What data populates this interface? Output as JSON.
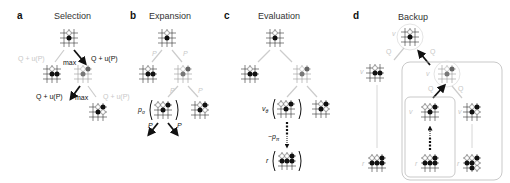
{
  "figure": {
    "panels": [
      {
        "letter": "a",
        "title": "Selection"
      },
      {
        "letter": "b",
        "title": "Expansion"
      },
      {
        "letter": "c",
        "title": "Evaluation"
      },
      {
        "letter": "d",
        "title": "Backup"
      }
    ],
    "selection": {
      "left_edge_label": "Q + u(P)",
      "right_edge_label": "Q + u(P)",
      "max_label_1": "max",
      "second_left_label": "Q + u(P)",
      "max_label_2": "max",
      "second_right_label": "Q + u(P)"
    },
    "expansion": {
      "edge_p": "P",
      "policy_label": "p",
      "policy_sub": "σ",
      "out_left": "P",
      "out_right": "P"
    },
    "evaluation": {
      "value_label": "v",
      "value_sub": "θ",
      "rollout_label": "p",
      "rollout_sub": "π",
      "reward_label": "r"
    },
    "backup": {
      "q_label": "Q",
      "v_label": "v",
      "v_sub": "θ",
      "r_label": "r"
    },
    "colors": {
      "active": "#111111",
      "inactive": "#cccccc",
      "box": "#bbbbbb"
    }
  }
}
